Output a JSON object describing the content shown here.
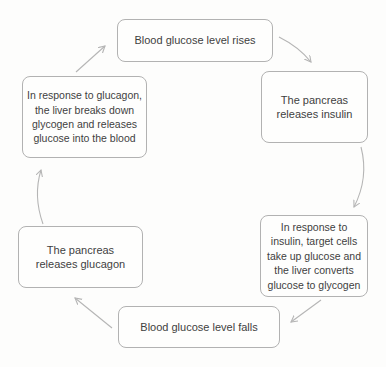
{
  "diagram": {
    "type": "cycle",
    "topic": "Blood glucose regulation cycle",
    "nodes": [
      {
        "id": "rise",
        "label": "Blood glucose level rises"
      },
      {
        "id": "insulin",
        "label": "The pancreas releases insulin"
      },
      {
        "id": "insulin-response",
        "label": "In response to insulin, target cells take up glucose and the liver converts glucose to glycogen"
      },
      {
        "id": "fall",
        "label": "Blood glucose level falls"
      },
      {
        "id": "glucagon",
        "label": "The pancreas releases glucagon"
      },
      {
        "id": "glucagon-response",
        "label": "In response to glucagon, the liver breaks down glycogen and releases glucose into the blood"
      }
    ],
    "edges": [
      {
        "from": "rise",
        "to": "insulin"
      },
      {
        "from": "insulin",
        "to": "insulin-response"
      },
      {
        "from": "insulin-response",
        "to": "fall"
      },
      {
        "from": "fall",
        "to": "glucagon"
      },
      {
        "from": "glucagon",
        "to": "glucagon-response"
      },
      {
        "from": "glucagon-response",
        "to": "rise"
      }
    ],
    "colors": {
      "box_fill": "#fefefd",
      "box_border": "#b2b2b2",
      "text": "#3f3f3f",
      "arrow": "#b5b5b5",
      "background": "#fdfdfc"
    }
  }
}
